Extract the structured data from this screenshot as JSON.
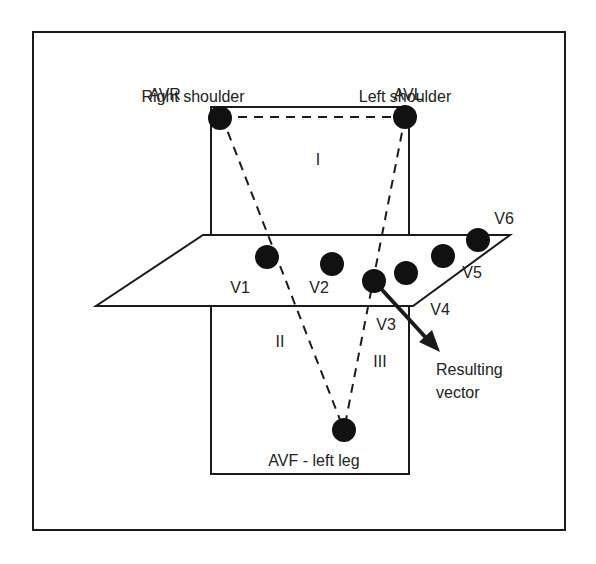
{
  "diagram": {
    "labels": {
      "right_shoulder": "Right shoulder",
      "avr": "AVR",
      "left_shoulder": "Left shoulder",
      "avl": "AVL",
      "lead_i": "I",
      "lead_ii": "II",
      "lead_iii": "III",
      "v1": "V1",
      "v2": "V2",
      "v3": "V3",
      "v4": "V4",
      "v5": "V5",
      "v6": "V6",
      "resulting": "Resulting",
      "vector": "vector",
      "avf": "AVF - left leg"
    },
    "colors": {
      "stroke": "#1a1a1a",
      "electrode": "#111111",
      "background": "#ffffff"
    }
  }
}
